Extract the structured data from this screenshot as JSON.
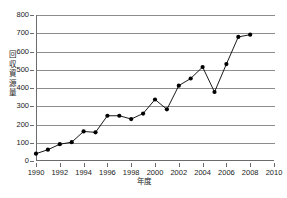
{
  "chart_data": {
    "type": "line",
    "title": "",
    "xlabel": "年度",
    "ylabel": "回収資源量",
    "xlim": [
      1990,
      2010
    ],
    "ylim": [
      0,
      800
    ],
    "grid": true,
    "legend": false,
    "marker": "filled-circle",
    "line_color": "#000000",
    "marker_color": "#000000",
    "grid_color": "#8d8d8d",
    "axis_color": "#6b6b6b",
    "background_color": "#ffffff",
    "x_tick_labels": [
      "1990",
      "1992",
      "1994",
      "1996",
      "1998",
      "2000",
      "2002",
      "2004",
      "2006",
      "2008",
      "2010"
    ],
    "x_tick_values": [
      1990,
      1992,
      1994,
      1996,
      1998,
      2000,
      2002,
      2004,
      2006,
      2008,
      2010
    ],
    "y_tick_labels": [
      "0",
      "100",
      "200",
      "300",
      "400",
      "500",
      "600",
      "700",
      "800"
    ],
    "y_tick_values": [
      0,
      100,
      200,
      300,
      400,
      500,
      600,
      700,
      800
    ],
    "x": [
      1990,
      1991,
      1992,
      1993,
      1994,
      1995,
      1996,
      1997,
      1998,
      1999,
      2000,
      2001,
      2002,
      2003,
      2004,
      2005,
      2006,
      2007,
      2008
    ],
    "values": [
      40,
      62,
      92,
      103,
      162,
      157,
      248,
      248,
      230,
      260,
      337,
      283,
      413,
      452,
      515,
      378,
      531,
      680,
      692
    ],
    "series": [
      {
        "name": "回収資源量",
        "values": [
          40,
          62,
          92,
          103,
          162,
          157,
          248,
          248,
          230,
          260,
          337,
          283,
          413,
          452,
          515,
          378,
          531,
          680,
          692
        ]
      }
    ]
  }
}
